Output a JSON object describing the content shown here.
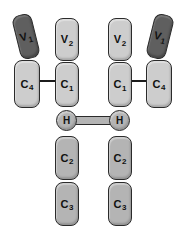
{
  "figure": {
    "colors": {
      "background": "#ffffff",
      "dark_domain": "#5f5f5f",
      "light_domain": "#cdcdcd",
      "medium_domain": "#b4b4b4",
      "outline": "#2b2b2b",
      "text": "#111111"
    },
    "domains": {
      "v1_left": {
        "letter": "V",
        "sub": "1"
      },
      "v2_left": {
        "letter": "V",
        "sub": "2"
      },
      "v2_right": {
        "letter": "V",
        "sub": "2"
      },
      "v1_right": {
        "letter": "V",
        "sub": "1"
      },
      "c4_left": {
        "letter": "C",
        "sub": "4"
      },
      "c1_left": {
        "letter": "C",
        "sub": "1"
      },
      "c1_right": {
        "letter": "C",
        "sub": "1"
      },
      "c4_right": {
        "letter": "C",
        "sub": "4"
      },
      "hinge_left": {
        "letter": "H",
        "sub": ""
      },
      "hinge_right": {
        "letter": "H",
        "sub": ""
      },
      "c2_left": {
        "letter": "C",
        "sub": "2"
      },
      "c2_right": {
        "letter": "C",
        "sub": "2"
      },
      "c3_left": {
        "letter": "C",
        "sub": "3"
      },
      "c3_right": {
        "letter": "C",
        "sub": "3"
      }
    }
  }
}
